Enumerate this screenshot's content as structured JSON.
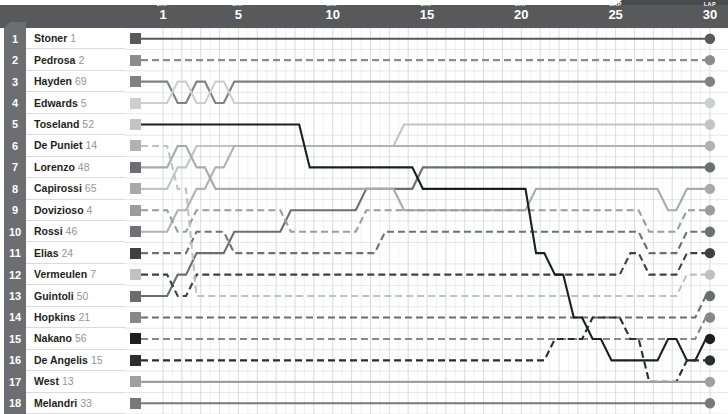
{
  "header": {
    "lap_word": "LAP",
    "ticks": [
      {
        "lap": 1,
        "label": "1"
      },
      {
        "lap": 5,
        "label": "5"
      },
      {
        "lap": 10,
        "label": "10"
      },
      {
        "lap": 15,
        "label": "15"
      },
      {
        "lap": 20,
        "label": "20"
      },
      {
        "lap": 25,
        "label": "25"
      },
      {
        "lap": 30,
        "label": "30"
      }
    ],
    "bar_color": "#58595b",
    "tab_color": "#4a4b4d",
    "text_color": "#ffffff"
  },
  "rail": {
    "color": "#6d6e71",
    "text_color": "#ffffff"
  },
  "riders": [
    {
      "rank": "1",
      "name": "Stoner",
      "number": "1",
      "color": "#58595b",
      "dash": "solid"
    },
    {
      "rank": "2",
      "name": "Pedrosa",
      "number": "2",
      "color": "#8a8c8e",
      "dash": "dashed"
    },
    {
      "rank": "3",
      "name": "Hayden",
      "number": "69",
      "color": "#7f8184",
      "dash": "solid"
    },
    {
      "rank": "4",
      "name": "Edwards",
      "number": "5",
      "color": "#cdced0",
      "dash": "solid"
    },
    {
      "rank": "5",
      "name": "Toseland",
      "number": "52",
      "color": "#c2c4c6",
      "dash": "solid"
    },
    {
      "rank": "6",
      "name": "De Puniet",
      "number": "14",
      "color": "#b0b2b5",
      "dash": "solid"
    },
    {
      "rank": "7",
      "name": "Lorenzo",
      "number": "48",
      "color": "#6d6e71",
      "dash": "solid"
    },
    {
      "rank": "8",
      "name": "Capirossi",
      "number": "65",
      "color": "#a7a9ac",
      "dash": "solid"
    },
    {
      "rank": "9",
      "name": "Dovizioso",
      "number": "4",
      "color": "#9a9c9f",
      "dash": "dashed"
    },
    {
      "rank": "10",
      "name": "Rossi",
      "number": "46",
      "color": "#6f7073",
      "dash": "dashed"
    },
    {
      "rank": "11",
      "name": "Elias",
      "number": "24",
      "color": "#3f4042",
      "dash": "dashed"
    },
    {
      "rank": "12",
      "name": "Vermeulen",
      "number": "7",
      "color": "#bfc1c3",
      "dash": "dashed"
    },
    {
      "rank": "13",
      "name": "Guintoli",
      "number": "50",
      "color": "#6a6c6e",
      "dash": "dashed"
    },
    {
      "rank": "14",
      "name": "Hopkins",
      "number": "21",
      "color": "#86888b",
      "dash": "dashed"
    },
    {
      "rank": "15",
      "name": "Nakano",
      "number": "56",
      "color": "#1d1e20",
      "dash": "solid"
    },
    {
      "rank": "16",
      "name": "De Angelis",
      "number": "15",
      "color": "#2c2d2f",
      "dash": "dashed"
    },
    {
      "rank": "17",
      "name": "West",
      "number": "13",
      "color": "#9d9fa2",
      "dash": "solid"
    },
    {
      "rank": "18",
      "name": "Melandri",
      "number": "33",
      "color": "#76787b",
      "dash": "solid"
    }
  ],
  "chart_data": {
    "type": "line",
    "title": "",
    "xlabel": "LAP",
    "ylabel": "Position",
    "x": [
      1,
      2,
      3,
      4,
      5,
      6,
      7,
      8,
      9,
      10,
      11,
      12,
      13,
      14,
      15,
      16,
      17,
      18,
      19,
      20,
      21,
      22,
      23,
      24,
      25,
      26,
      27,
      28,
      29,
      30
    ],
    "xlim": [
      1,
      30
    ],
    "ylim": [
      1,
      18
    ],
    "grid": true,
    "legend": "left-row-labels",
    "note": "Rider race position by lap; y value = track position (1 = leader). Final value equals the rank shown at left.",
    "series": [
      {
        "name": "Stoner",
        "number": "1",
        "color": "#58595b",
        "dash": "solid",
        "values": [
          1,
          1,
          1,
          1,
          1,
          1,
          1,
          1,
          1,
          1,
          1,
          1,
          1,
          1,
          1,
          1,
          1,
          1,
          1,
          1,
          1,
          1,
          1,
          1,
          1,
          1,
          1,
          1,
          1,
          1
        ]
      },
      {
        "name": "Pedrosa",
        "number": "2",
        "color": "#8a8c8e",
        "dash": "dashed",
        "values": [
          2,
          2,
          2,
          2,
          2,
          2,
          2,
          2,
          2,
          2,
          2,
          2,
          2,
          2,
          2,
          2,
          2,
          2,
          2,
          2,
          2,
          2,
          2,
          2,
          2,
          2,
          2,
          2,
          2,
          2
        ]
      },
      {
        "name": "Hayden",
        "number": "69",
        "color": "#7f8184",
        "dash": "solid",
        "values": [
          3,
          4,
          3,
          4,
          3,
          3,
          3,
          3,
          3,
          3,
          3,
          3,
          3,
          3,
          3,
          3,
          3,
          3,
          3,
          3,
          3,
          3,
          3,
          3,
          3,
          3,
          3,
          3,
          3,
          3
        ]
      },
      {
        "name": "Edwards",
        "number": "5",
        "color": "#cdced0",
        "dash": "solid",
        "values": [
          4,
          3,
          4,
          3,
          4,
          4,
          4,
          4,
          4,
          4,
          4,
          4,
          4,
          4,
          4,
          4,
          4,
          4,
          4,
          4,
          4,
          4,
          4,
          4,
          4,
          4,
          4,
          4,
          4,
          4
        ]
      },
      {
        "name": "Toseland",
        "number": "52",
        "color": "#c2c4c6",
        "dash": "solid",
        "values": [
          8,
          7,
          6,
          6,
          6,
          6,
          6,
          6,
          6,
          6,
          6,
          6,
          6,
          5,
          5,
          5,
          5,
          5,
          5,
          5,
          5,
          5,
          5,
          5,
          5,
          5,
          5,
          5,
          5,
          5
        ]
      },
      {
        "name": "De Puniet",
        "number": "14",
        "color": "#b0b2b5",
        "dash": "solid",
        "values": [
          10,
          9,
          8,
          7,
          6,
          6,
          6,
          6,
          6,
          6,
          6,
          6,
          6,
          6,
          6,
          6,
          6,
          6,
          6,
          6,
          6,
          6,
          6,
          6,
          6,
          6,
          6,
          6,
          6,
          6
        ]
      },
      {
        "name": "Lorenzo",
        "number": "48",
        "color": "#6d6e71",
        "dash": "solid",
        "values": [
          13,
          12,
          11,
          11,
          10,
          10,
          10,
          9,
          9,
          9,
          9,
          8,
          8,
          8,
          7,
          7,
          7,
          7,
          7,
          7,
          7,
          7,
          7,
          7,
          7,
          7,
          7,
          7,
          7,
          7
        ]
      },
      {
        "name": "Capirossi",
        "number": "65",
        "color": "#a7a9ac",
        "dash": "solid",
        "values": [
          7,
          6,
          7,
          8,
          8,
          8,
          8,
          8,
          8,
          8,
          8,
          8,
          8,
          9,
          9,
          9,
          9,
          9,
          9,
          9,
          8,
          8,
          8,
          8,
          8,
          8,
          8,
          9,
          8,
          8
        ]
      },
      {
        "name": "Dovizioso",
        "number": "4",
        "color": "#9a9c9f",
        "dash": "dashed",
        "values": [
          9,
          10,
          9,
          9,
          9,
          9,
          9,
          10,
          10,
          10,
          10,
          9,
          9,
          9,
          9,
          9,
          9,
          9,
          9,
          9,
          9,
          9,
          9,
          9,
          9,
          9,
          10,
          10,
          9,
          9
        ]
      },
      {
        "name": "Rossi",
        "number": "46",
        "color": "#6f7073",
        "dash": "dashed",
        "values": [
          11,
          11,
          10,
          10,
          11,
          11,
          11,
          11,
          11,
          11,
          11,
          11,
          10,
          10,
          10,
          10,
          10,
          10,
          10,
          10,
          10,
          10,
          10,
          10,
          10,
          10,
          11,
          11,
          10,
          10
        ]
      },
      {
        "name": "Elias",
        "number": "24",
        "color": "#3f4042",
        "dash": "dashed",
        "values": [
          12,
          13,
          12,
          12,
          12,
          12,
          12,
          12,
          12,
          12,
          12,
          12,
          12,
          12,
          12,
          12,
          12,
          12,
          12,
          12,
          12,
          12,
          12,
          12,
          12,
          11,
          12,
          12,
          11,
          11
        ]
      },
      {
        "name": "Vermeulen",
        "number": "7",
        "color": "#bfc1c3",
        "dash": "dashed",
        "values": [
          6,
          8,
          13,
          13,
          13,
          13,
          13,
          13,
          13,
          13,
          13,
          13,
          13,
          13,
          13,
          13,
          13,
          13,
          13,
          13,
          13,
          13,
          13,
          13,
          13,
          13,
          13,
          13,
          12,
          12
        ]
      },
      {
        "name": "Guintoli",
        "number": "50",
        "color": "#6a6c6e",
        "dash": "dashed",
        "values": [
          14,
          14,
          14,
          14,
          14,
          14,
          14,
          14,
          14,
          14,
          14,
          14,
          14,
          14,
          14,
          14,
          14,
          14,
          14,
          14,
          14,
          14,
          14,
          14,
          14,
          14,
          14,
          14,
          14,
          13
        ]
      },
      {
        "name": "Hopkins",
        "number": "21",
        "color": "#86888b",
        "dash": "dashed",
        "values": [
          15,
          15,
          15,
          15,
          15,
          15,
          15,
          15,
          15,
          15,
          15,
          15,
          15,
          15,
          15,
          15,
          15,
          15,
          15,
          15,
          15,
          15,
          15,
          15,
          15,
          15,
          15,
          15,
          15,
          14
        ]
      },
      {
        "name": "Nakano",
        "number": "56",
        "color": "#1d1e20",
        "dash": "solid",
        "values": [
          5,
          5,
          5,
          5,
          5,
          5,
          5,
          5,
          7,
          7,
          7,
          7,
          7,
          7,
          8,
          8,
          8,
          8,
          8,
          8,
          11,
          12,
          14,
          15,
          16,
          16,
          16,
          15,
          16,
          15
        ]
      },
      {
        "name": "De Angelis",
        "number": "15",
        "color": "#2c2d2f",
        "dash": "dashed",
        "values": [
          16,
          16,
          16,
          16,
          16,
          16,
          16,
          16,
          16,
          16,
          16,
          16,
          16,
          16,
          16,
          16,
          16,
          16,
          16,
          16,
          16,
          15,
          15,
          14,
          14,
          15,
          17,
          17,
          16,
          16
        ]
      },
      {
        "name": "West",
        "number": "13",
        "color": "#9d9fa2",
        "dash": "solid",
        "values": [
          17,
          17,
          17,
          17,
          17,
          17,
          17,
          17,
          17,
          17,
          17,
          17,
          17,
          17,
          17,
          17,
          17,
          17,
          17,
          17,
          17,
          17,
          17,
          17,
          17,
          17,
          17,
          17,
          17,
          17
        ]
      },
      {
        "name": "Melandri",
        "number": "33",
        "color": "#76787b",
        "dash": "solid",
        "values": [
          18,
          18,
          18,
          18,
          18,
          18,
          18,
          18,
          18,
          18,
          18,
          18,
          18,
          18,
          18,
          18,
          18,
          18,
          18,
          18,
          18,
          18,
          18,
          18,
          18,
          18,
          18,
          18,
          18,
          18
        ]
      }
    ]
  }
}
